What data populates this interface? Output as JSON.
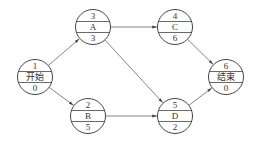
{
  "diagram": {
    "type": "network-diagram",
    "nodes": [
      {
        "id": "1",
        "label": "开始",
        "top": "1",
        "bottom": "0",
        "cx": 35,
        "cy": 77
      },
      {
        "id": "3",
        "label": "A",
        "top": "3",
        "bottom": "3",
        "cx": 93,
        "cy": 27
      },
      {
        "id": "2",
        "label": "B",
        "top": "2",
        "bottom": "5",
        "cx": 88,
        "cy": 116
      },
      {
        "id": "4",
        "label": "C",
        "top": "4",
        "bottom": "6",
        "cx": 175,
        "cy": 27
      },
      {
        "id": "5",
        "label": "D",
        "top": "5",
        "bottom": "2",
        "cx": 175,
        "cy": 116
      },
      {
        "id": "6",
        "label": "结束",
        "top": "6",
        "bottom": "0",
        "cx": 226,
        "cy": 77
      }
    ],
    "edges": [
      {
        "from": "1",
        "to": "3"
      },
      {
        "from": "1",
        "to": "2"
      },
      {
        "from": "3",
        "to": "4"
      },
      {
        "from": "3",
        "to": "5"
      },
      {
        "from": "2",
        "to": "5"
      },
      {
        "from": "4",
        "to": "6"
      },
      {
        "from": "5",
        "to": "6"
      }
    ],
    "colors": {
      "stroke": "#444444",
      "edge": "#666666",
      "text": "#333333",
      "background": "#ffffff"
    }
  }
}
